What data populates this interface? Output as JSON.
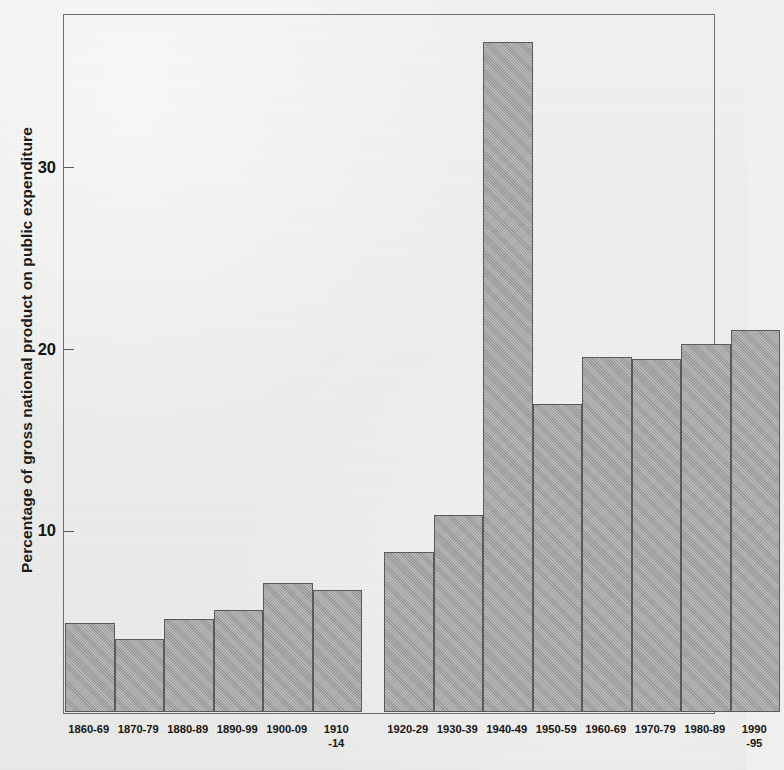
{
  "chart_data": {
    "type": "bar",
    "title": "",
    "xlabel": "",
    "ylabel": "Percentage of gross national product on public expenditure",
    "ylim": [
      0,
      38.5
    ],
    "yticks": [
      10,
      20,
      30
    ],
    "ytick_labels": [
      "10",
      "20",
      "30"
    ],
    "grid": false,
    "legend": null,
    "gap_after_category": "1910-14",
    "categories": [
      "1860-69",
      "1870-79",
      "1880-89",
      "1890-99",
      "1900-09",
      "1910-14",
      "1920-29",
      "1930-39",
      "1940-49",
      "1950-59",
      "1960-69",
      "1970-79",
      "1980-89",
      "1990-95"
    ],
    "category_labels": [
      {
        "line1": "1860-69",
        "line2": ""
      },
      {
        "line1": "1870-79",
        "line2": ""
      },
      {
        "line1": "1880-89",
        "line2": ""
      },
      {
        "line1": "1890-99",
        "line2": ""
      },
      {
        "line1": "1900-09",
        "line2": ""
      },
      {
        "line1": "1910",
        "line2": "-14"
      },
      {
        "line1": "1920-29",
        "line2": ""
      },
      {
        "line1": "1930-39",
        "line2": ""
      },
      {
        "line1": "1940-49",
        "line2": ""
      },
      {
        "line1": "1950-59",
        "line2": ""
      },
      {
        "line1": "1960-69",
        "line2": ""
      },
      {
        "line1": "1970-79",
        "line2": ""
      },
      {
        "line1": "1980-89",
        "line2": ""
      },
      {
        "line1": "1990",
        "line2": "-95"
      }
    ],
    "values": [
      4.9,
      4.0,
      5.1,
      5.6,
      7.1,
      6.7,
      8.8,
      10.8,
      36.8,
      16.9,
      19.5,
      19.4,
      20.2,
      21.0
    ],
    "colors": {
      "bar_fill": "#9e9e9e",
      "bar_edge": "#5a5a5a",
      "axis": "#6d6d6d",
      "text": "#141414",
      "background": "#ececeb"
    }
  }
}
